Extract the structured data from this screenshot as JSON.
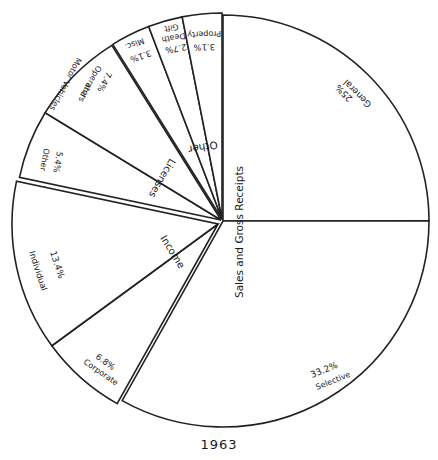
{
  "chart_data": {
    "type": "pie",
    "title": "1963",
    "groups": [
      {
        "name": "Sales and Gross Receipts",
        "slices": [
          {
            "label": "General",
            "value": 25.0,
            "value_label": "25%"
          },
          {
            "label": "Selective",
            "value": 33.2,
            "value_label": "33.2%"
          }
        ]
      },
      {
        "name": "Income",
        "slices": [
          {
            "label": "Corporate",
            "value": 6.8,
            "value_label": "6.8%"
          },
          {
            "label": "Individual",
            "value": 13.4,
            "value_label": "13.4%"
          }
        ]
      },
      {
        "name": "Licenses",
        "slices": [
          {
            "label": "Other",
            "value": 5.4,
            "value_label": "5.4%"
          },
          {
            "label": "Motor Vehicles Operators and",
            "value": 7.4,
            "value_label": "7.4%"
          }
        ]
      },
      {
        "name": "Other",
        "slices": [
          {
            "label": "Misc.",
            "value": 3.1,
            "value_label": "3.1%"
          },
          {
            "label": "Death Gift",
            "value": 2.7,
            "value_label": "2.7%"
          },
          {
            "label": "Property",
            "value": 3.1,
            "value_label": "3.1%"
          }
        ]
      }
    ],
    "categories": [
      "General",
      "Selective",
      "Corporate",
      "Individual",
      "Licenses Other",
      "Motor Vehicles Operators and",
      "Misc.",
      "Death Gift",
      "Property"
    ],
    "values": [
      25.0,
      33.2,
      6.8,
      13.4,
      5.4,
      7.4,
      3.1,
      2.7,
      3.1
    ],
    "legend": "none",
    "grid": false
  },
  "caption": "1963",
  "group_labels": {
    "sales": "Sales and Gross Receipts",
    "income": "Income",
    "licenses": "Licenses",
    "other": "Other"
  },
  "slice_labels": {
    "general_pct": "25%",
    "general": "General",
    "selective_pct": "33.2%",
    "selective": "Selective",
    "corporate_pct": "6.8%",
    "corporate": "Corporate",
    "individual_pct": "13.4%",
    "individual": "Individual",
    "lic_other_pct": "5.4%",
    "lic_other": "Other",
    "motor_pct": "7.4%",
    "motor1": "Operators",
    "motor2": "and",
    "motor3": "Motor Vehicles",
    "misc_pct": "3.1%",
    "misc": "Misc.",
    "death_pct": "2.7%",
    "death1": "Death",
    "death2": "Gift",
    "property_pct": "3.1%",
    "property": "Property"
  }
}
